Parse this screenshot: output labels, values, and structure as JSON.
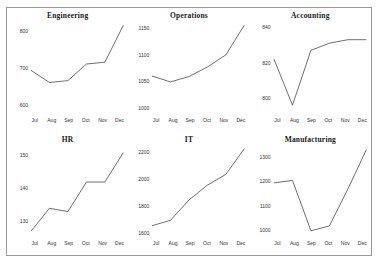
{
  "figure": {
    "background_color": "#ffffff",
    "border_color": "#9a9a9a",
    "line_color": "#4a4a4a"
  },
  "chart_data": [
    {
      "type": "line",
      "title": "Engineering",
      "xlabel": "",
      "ylabel": "",
      "categories": [
        "Jul",
        "Aug",
        "Sep",
        "Oct",
        "Nov",
        "Dec"
      ],
      "values": [
        694,
        661,
        666,
        711,
        716,
        816
      ],
      "yticks": [
        600,
        700,
        800
      ],
      "ylim": [
        585,
        825
      ],
      "grid": false,
      "legend": false
    },
    {
      "type": "line",
      "title": "Operations",
      "xlabel": "",
      "ylabel": "",
      "categories": [
        "Jul",
        "Aug",
        "Sep",
        "Oct",
        "Nov",
        "Dec"
      ],
      "values": [
        1060,
        1049,
        1059,
        1077,
        1100,
        1156
      ],
      "yticks": [
        1000,
        1050,
        1100,
        1150
      ],
      "ylim": [
        995,
        1162
      ],
      "grid": false,
      "legend": false
    },
    {
      "type": "line",
      "title": "Accounting",
      "xlabel": "",
      "ylabel": "",
      "categories": [
        "Jul",
        "Aug",
        "Sep",
        "Oct",
        "Nov",
        "Dec"
      ],
      "values": [
        822,
        796,
        827,
        831,
        833,
        833
      ],
      "yticks": [
        800,
        820,
        840
      ],
      "ylim": [
        793,
        843
      ],
      "grid": false,
      "legend": false
    },
    {
      "type": "line",
      "title": "HR",
      "xlabel": "",
      "ylabel": "",
      "categories": [
        "Jul",
        "Aug",
        "Sep",
        "Oct",
        "Nov",
        "Dec"
      ],
      "values": [
        127,
        134,
        133,
        142,
        142,
        151
      ],
      "yticks": [
        130,
        140,
        150
      ],
      "ylim": [
        126,
        153
      ],
      "grid": false,
      "legend": false
    },
    {
      "type": "line",
      "title": "IT",
      "xlabel": "",
      "ylabel": "",
      "categories": [
        "Jul",
        "Aug",
        "Sep",
        "Oct",
        "Nov",
        "Dec"
      ],
      "values": [
        1660,
        1700,
        1850,
        1960,
        2040,
        2230
      ],
      "yticks": [
        1600,
        1800,
        2000,
        2200
      ],
      "ylim": [
        1595,
        2250
      ],
      "grid": false,
      "legend": false
    },
    {
      "type": "line",
      "title": "Manufacturing",
      "xlabel": "",
      "ylabel": "",
      "categories": [
        "Jul",
        "Aug",
        "Sep",
        "Oct",
        "Nov",
        "Dec"
      ],
      "values": [
        1195,
        1205,
        1000,
        1020,
        1170,
        1330
      ],
      "yticks": [
        1000,
        1100,
        1200,
        1300
      ],
      "ylim": [
        985,
        1345
      ],
      "grid": false,
      "legend": false
    }
  ]
}
